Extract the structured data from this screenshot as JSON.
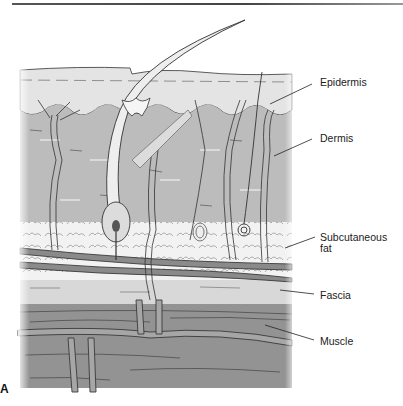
{
  "figure": {
    "panel_letter": "A",
    "labels": {
      "epidermis": "Epidermis",
      "dermis": "Dermis",
      "subcutaneous_fat_line1": "Subcutaneous",
      "subcutaneous_fat_line2": "fat",
      "fascia": "Fascia",
      "muscle": "Muscle"
    },
    "colors": {
      "epidermis": "#e2e2e2",
      "dermis": "#b9b9b9",
      "fat": "#efefef",
      "fascia": "#d6d6d6",
      "muscle": "#8e8e8e",
      "vessel": "#6a6a6a",
      "line": "#2a2a2a"
    }
  }
}
